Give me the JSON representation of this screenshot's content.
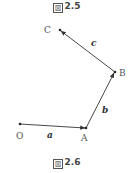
{
  "captions": {
    "top": {
      "mark": "図",
      "number": "2.5"
    },
    "bottom": {
      "mark": "図",
      "number": "2.6"
    }
  },
  "points": {
    "O": {
      "label": "O",
      "x": 20,
      "y": 124
    },
    "A": {
      "label": "A",
      "x": 86,
      "y": 128
    },
    "B": {
      "label": "B",
      "x": 115,
      "y": 72
    },
    "C": {
      "label": "C",
      "x": 60,
      "y": 30
    }
  },
  "vectors": {
    "a": {
      "label": "a",
      "from": "O",
      "to": "A"
    },
    "b": {
      "label": "b",
      "from": "A",
      "to": "B"
    },
    "c": {
      "label": "c",
      "from": "B",
      "to": "C"
    }
  },
  "colors": {
    "line": "#333333",
    "label": "#555555"
  }
}
